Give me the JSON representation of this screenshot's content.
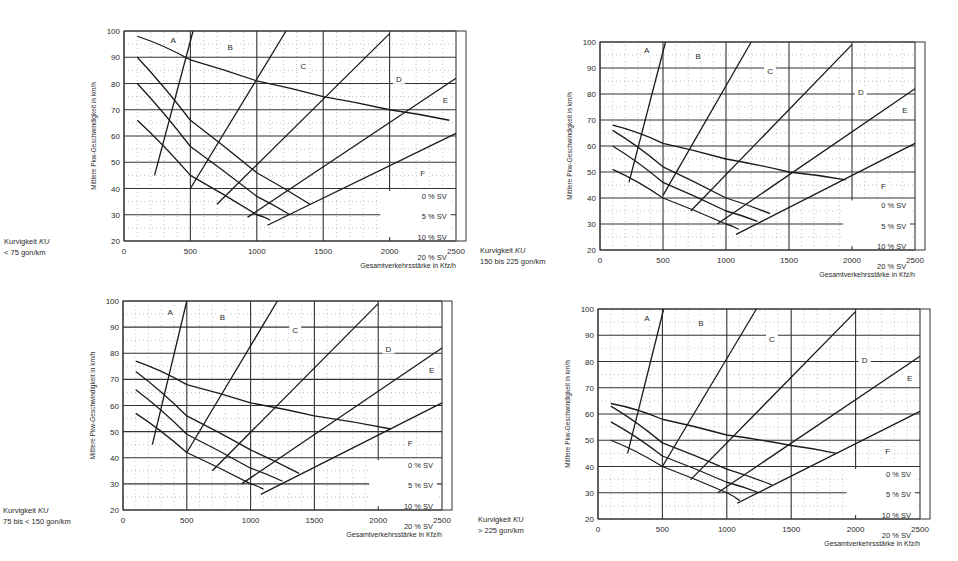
{
  "document": {
    "common": {
      "ylabel": "Mittlere Pkw-Geschwindigkeit in km/h",
      "xlabel": "Gesamtverkehrsstärke in Kfz/h",
      "x_ticks": [
        0,
        500,
        1000,
        1500,
        2000,
        2500
      ],
      "y_ticks": [
        20,
        30,
        40,
        50,
        60,
        70,
        80,
        90,
        100
      ],
      "los_labels": [
        "A",
        "B",
        "C",
        "D",
        "E",
        "F"
      ],
      "sv_legend": [
        "0 % SV",
        "5 % SV",
        "10 % SV",
        "20 % SV"
      ],
      "curvature_label": "Kurvigkeit KU"
    }
  },
  "chart_data": [
    {
      "type": "line",
      "title": "Kurvigkeit KU < 75 gon/km",
      "curvature_range": "< 75 gon/km",
      "xlabel": "Gesamtverkehrsstärke in Kfz/h",
      "ylabel": "Mittlere Pkw-Geschwindigkeit in km/h",
      "xlim": [
        0,
        2500
      ],
      "ylim": [
        20,
        100
      ],
      "grid": true,
      "series": [
        {
          "name": "0 % SV",
          "x": [
            100,
            500,
            1000,
            1500,
            2000,
            2450
          ],
          "y": [
            98,
            89,
            81,
            75,
            70,
            66
          ]
        },
        {
          "name": "5 % SV",
          "x": [
            100,
            500,
            1000,
            1400
          ],
          "y": [
            90,
            66,
            46,
            34
          ]
        },
        {
          "name": "10 % SV",
          "x": [
            100,
            500,
            1000,
            1250
          ],
          "y": [
            80,
            56,
            37,
            30
          ]
        },
        {
          "name": "20 % SV",
          "x": [
            100,
            500,
            1000,
            1100
          ],
          "y": [
            66,
            45,
            30,
            28
          ]
        }
      ],
      "los_boundaries": [
        {
          "name": "A/B",
          "x": [
            230,
            520
          ],
          "y": [
            45,
            100
          ]
        },
        {
          "name": "B/C",
          "x": [
            500,
            1220
          ],
          "y": [
            40,
            100
          ]
        },
        {
          "name": "C/D",
          "x": [
            700,
            2000
          ],
          "y": [
            34,
            99
          ]
        },
        {
          "name": "D/E",
          "x": [
            930,
            2500
          ],
          "y": [
            29,
            82
          ]
        },
        {
          "name": "E/F",
          "x": [
            1080,
            2500
          ],
          "y": [
            26,
            61
          ]
        }
      ],
      "los_label_positions": [
        {
          "label": "A",
          "x": 370,
          "y": 96
        },
        {
          "label": "B",
          "x": 800,
          "y": 93
        },
        {
          "label": "C",
          "x": 1350,
          "y": 86
        },
        {
          "label": "D",
          "x": 2070,
          "y": 81
        },
        {
          "label": "E",
          "x": 2420,
          "y": 73
        },
        {
          "label": "F",
          "x": 2250,
          "y": 45
        }
      ]
    },
    {
      "type": "line",
      "title": "Kurvigkeit KU 150 bis 225 gon/km",
      "curvature_range": "150 bis 225 gon/km",
      "xlabel": "Gesamtverkehrsstärke in Kfz/h",
      "ylabel": "Mittlere Pkw-Geschwindigkeit in km/h",
      "xlim": [
        0,
        2500
      ],
      "ylim": [
        20,
        100
      ],
      "grid": true,
      "series": [
        {
          "name": "0 % SV",
          "x": [
            100,
            500,
            1000,
            1500,
            1950
          ],
          "y": [
            68,
            61,
            55,
            50,
            47
          ]
        },
        {
          "name": "5 % SV",
          "x": [
            100,
            500,
            1000,
            1350
          ],
          "y": [
            66,
            52,
            40,
            34
          ]
        },
        {
          "name": "10 % SV",
          "x": [
            100,
            500,
            1000,
            1250
          ],
          "y": [
            60,
            46,
            35,
            31
          ]
        },
        {
          "name": "20 % SV",
          "x": [
            100,
            500,
            1000,
            1100
          ],
          "y": [
            51,
            40,
            30,
            28
          ]
        }
      ],
      "los_boundaries": [
        {
          "name": "A/B",
          "x": [
            230,
            520
          ],
          "y": [
            46,
            100
          ]
        },
        {
          "name": "B/C",
          "x": [
            500,
            1200
          ],
          "y": [
            41,
            100
          ]
        },
        {
          "name": "C/D",
          "x": [
            720,
            2000
          ],
          "y": [
            35,
            99
          ]
        },
        {
          "name": "D/E",
          "x": [
            930,
            2500
          ],
          "y": [
            30,
            82
          ]
        },
        {
          "name": "E/F",
          "x": [
            1080,
            2500
          ],
          "y": [
            26,
            61
          ]
        }
      ],
      "los_label_positions": [
        {
          "label": "A",
          "x": 370,
          "y": 96
        },
        {
          "label": "B",
          "x": 780,
          "y": 94
        },
        {
          "label": "C",
          "x": 1350,
          "y": 88
        },
        {
          "label": "D",
          "x": 2070,
          "y": 80
        },
        {
          "label": "E",
          "x": 2420,
          "y": 73
        },
        {
          "label": "F",
          "x": 2250,
          "y": 44
        }
      ]
    },
    {
      "type": "line",
      "title": "Kurvigkeit KU 75 bis < 150 gon/km",
      "curvature_range": "75 bis < 150 gon/km",
      "xlabel": "Gesamtverkehrsstärke in Kfz/h",
      "ylabel": "Mittlere Pkw-Geschwindigkeit in km/h",
      "xlim": [
        0,
        2500
      ],
      "ylim": [
        20,
        100
      ],
      "grid": true,
      "series": [
        {
          "name": "0 % SV",
          "x": [
            100,
            500,
            1000,
            1500,
            2100
          ],
          "y": [
            77,
            68,
            61,
            56,
            51
          ]
        },
        {
          "name": "5 % SV",
          "x": [
            100,
            500,
            1000,
            1380
          ],
          "y": [
            73,
            56,
            43,
            34
          ]
        },
        {
          "name": "10 % SV",
          "x": [
            100,
            500,
            1000,
            1250
          ],
          "y": [
            66,
            49,
            36,
            31
          ]
        },
        {
          "name": "20 % SV",
          "x": [
            100,
            500,
            1000,
            1100
          ],
          "y": [
            57,
            42,
            30,
            28
          ]
        }
      ],
      "los_boundaries": [
        {
          "name": "A/B",
          "x": [
            230,
            500
          ],
          "y": [
            45,
            100
          ]
        },
        {
          "name": "B/C",
          "x": [
            500,
            1210
          ],
          "y": [
            42,
            100
          ]
        },
        {
          "name": "C/D",
          "x": [
            700,
            2000
          ],
          "y": [
            35,
            99
          ]
        },
        {
          "name": "D/E",
          "x": [
            930,
            2500
          ],
          "y": [
            30,
            82
          ]
        },
        {
          "name": "E/F",
          "x": [
            1080,
            2500
          ],
          "y": [
            26,
            61
          ]
        }
      ],
      "los_label_positions": [
        {
          "label": "A",
          "x": 370,
          "y": 95
        },
        {
          "label": "B",
          "x": 780,
          "y": 93
        },
        {
          "label": "C",
          "x": 1350,
          "y": 88
        },
        {
          "label": "D",
          "x": 2080,
          "y": 81
        },
        {
          "label": "E",
          "x": 2420,
          "y": 73
        },
        {
          "label": "F",
          "x": 2250,
          "y": 45
        }
      ]
    },
    {
      "type": "line",
      "title": "Kurvigkeit KU > 225 gon/km",
      "curvature_range": "> 225 gon/km",
      "xlabel": "Gesamtverkehrsstärke in Kfz/h",
      "ylabel": "Mittlere Pkw-Geschwindigkeit in km/h",
      "xlim": [
        0,
        2500
      ],
      "ylim": [
        20,
        100
      ],
      "grid": true,
      "series": [
        {
          "name": "0 % SV",
          "x": [
            100,
            500,
            1000,
            1500,
            1850
          ],
          "y": [
            64,
            58,
            52,
            48,
            45
          ]
        },
        {
          "name": "5 % SV",
          "x": [
            100,
            500,
            1000,
            1350
          ],
          "y": [
            63,
            49,
            39,
            33
          ]
        },
        {
          "name": "10 % SV",
          "x": [
            100,
            500,
            1000,
            1250
          ],
          "y": [
            57,
            44,
            34,
            30
          ]
        },
        {
          "name": "20 % SV",
          "x": [
            100,
            500,
            1000,
            1100
          ],
          "y": [
            50,
            40,
            30,
            27
          ]
        }
      ],
      "los_boundaries": [
        {
          "name": "A/B",
          "x": [
            230,
            510
          ],
          "y": [
            45,
            100
          ]
        },
        {
          "name": "B/C",
          "x": [
            500,
            1230
          ],
          "y": [
            40,
            100
          ]
        },
        {
          "name": "C/D",
          "x": [
            720,
            2000
          ],
          "y": [
            35,
            99
          ]
        },
        {
          "name": "D/E",
          "x": [
            930,
            2500
          ],
          "y": [
            30,
            82
          ]
        },
        {
          "name": "E/F",
          "x": [
            1080,
            2500
          ],
          "y": [
            26,
            61
          ]
        }
      ],
      "los_label_positions": [
        {
          "label": "A",
          "x": 380,
          "y": 96
        },
        {
          "label": "B",
          "x": 800,
          "y": 94
        },
        {
          "label": "C",
          "x": 1350,
          "y": 88
        },
        {
          "label": "D",
          "x": 2070,
          "y": 80
        },
        {
          "label": "E",
          "x": 2420,
          "y": 73
        },
        {
          "label": "F",
          "x": 2250,
          "y": 45
        }
      ]
    }
  ],
  "layout": {
    "panels": [
      {
        "x0": 124,
        "x1": 456,
        "y0": 241,
        "y1": 31
      },
      {
        "x0": 600,
        "x1": 915,
        "y0": 250,
        "y1": 42
      },
      {
        "x0": 123,
        "x1": 442,
        "y0": 510,
        "y1": 301
      },
      {
        "x0": 598,
        "x1": 920,
        "y0": 519,
        "y1": 309
      }
    ]
  }
}
